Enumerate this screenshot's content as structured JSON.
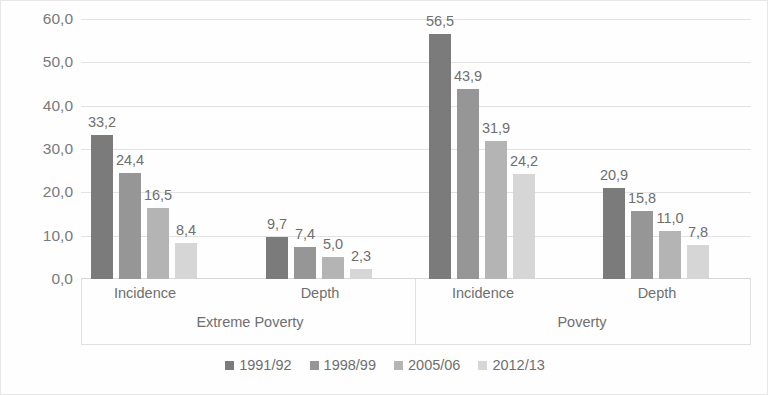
{
  "chart_data": {
    "type": "bar",
    "title": "",
    "subtitle": "",
    "xlabel": "",
    "ylabel": "",
    "ylim": [
      0,
      60
    ],
    "ytick_labels": [
      "0,0",
      "10,0",
      "20,0",
      "30,0",
      "40,0",
      "50,0",
      "60,0"
    ],
    "ytick_values": [
      0,
      10,
      20,
      30,
      40,
      50,
      60
    ],
    "grid": true,
    "legend_position": "bottom",
    "decimal_separator": ",",
    "panels": [
      "Extreme Poverty",
      "Poverty"
    ],
    "categories": [
      "Incidence",
      "Depth",
      "Incidence",
      "Depth"
    ],
    "category_groups": [
      {
        "panel": "Extreme Poverty",
        "category": "Incidence"
      },
      {
        "panel": "Extreme Poverty",
        "category": "Depth"
      },
      {
        "panel": "Poverty",
        "category": "Incidence"
      },
      {
        "panel": "Poverty",
        "category": "Depth"
      }
    ],
    "series": [
      {
        "name": "1991/92",
        "color": "#7b7b7b",
        "values": [
          33.2,
          9.7,
          56.5,
          20.9
        ],
        "labels": [
          "33,2",
          "9,7",
          "56,5",
          "20,9"
        ]
      },
      {
        "name": "1998/99",
        "color": "#969696",
        "values": [
          24.4,
          7.4,
          43.9,
          15.8
        ],
        "labels": [
          "24,4",
          "7,4",
          "43,9",
          "15,8"
        ]
      },
      {
        "name": "2005/06",
        "color": "#b4b4b4",
        "values": [
          16.5,
          5.0,
          31.9,
          11.0
        ],
        "labels": [
          "16,5",
          "5,0",
          "31,9",
          "11,0"
        ]
      },
      {
        "name": "2012/13",
        "color": "#d6d6d6",
        "values": [
          8.4,
          2.3,
          24.2,
          7.8
        ],
        "labels": [
          "8,4",
          "2,3",
          "24,2",
          "7,8"
        ]
      }
    ]
  },
  "legend": {
    "items": [
      {
        "label": "1991/92",
        "color": "#7b7b7b"
      },
      {
        "label": "1998/99",
        "color": "#969696"
      },
      {
        "label": "2005/06",
        "color": "#b4b4b4"
      },
      {
        "label": "2012/13",
        "color": "#d6d6d6"
      }
    ]
  },
  "axes": {
    "y_labels": [
      "60,0",
      "50,0",
      "40,0",
      "30,0",
      "20,0",
      "10,0",
      "0,0"
    ]
  },
  "colors": {
    "gridline": "#e2e2e2",
    "text": "#6f6f6f",
    "border": "#e6e6e6",
    "background": "#ffffff"
  }
}
